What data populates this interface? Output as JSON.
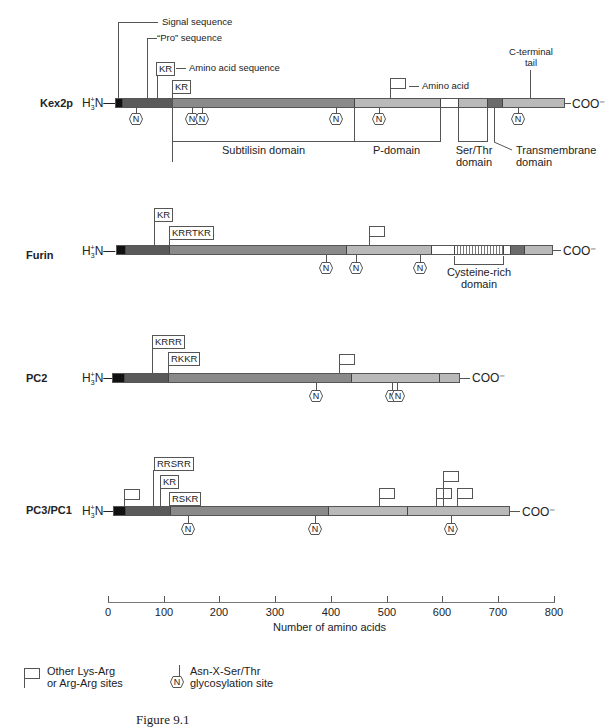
{
  "proteins": [
    {
      "name": "Kex2p",
      "n_term": "H3+N—",
      "c_term": "COO⁻"
    },
    {
      "name": "Furin",
      "n_term": "H3+N—",
      "c_term": "COO⁻"
    },
    {
      "name": "PC2",
      "n_term": "H3+N—",
      "c_term": "COO⁻"
    },
    {
      "name": "PC3/PC1",
      "n_term": "H3+N—",
      "c_term": "COO⁻"
    }
  ],
  "kex2p_annotations": {
    "signal": "Signal sequence",
    "pro": "“Pro” sequence",
    "kr1": "KR",
    "amino_acid_sequence": "Amino acid sequence",
    "kr2": "KR",
    "amino_acid": "Amino acid",
    "c_terminal_tail_1": "C-terminal",
    "c_terminal_tail_2": "tail",
    "subtilisin": "Subtilisin domain",
    "p_domain": "P-domain",
    "ser_thr_1": "Ser/Thr",
    "ser_thr_2": "domain",
    "tm_1": "Transmembrane",
    "tm_2": "domain"
  },
  "furin_annotations": {
    "kr": "KR",
    "krrtkr": "KRRTKR",
    "cys_1": "Cysteine-rich",
    "cys_2": "domain"
  },
  "pc2_annotations": {
    "krrr": "KRRR",
    "rkkr": "RKKR"
  },
  "pc3_annotations": {
    "rrsrr": "RRSRR",
    "kr": "KR",
    "rskr": "RSKR"
  },
  "glyc_symbol": "N",
  "axis": {
    "label": "Number of amino acids",
    "ticks": [
      "0",
      "100",
      "200",
      "300",
      "400",
      "500",
      "600",
      "700",
      "800"
    ]
  },
  "legend": {
    "flag_1": "Other Lys-Arg",
    "flag_2": "or Arg-Arg sites",
    "glyc_1": "Asn-X-Ser/Thr",
    "glyc_2": "glycosylation site"
  },
  "caption": "Figure 9.1"
}
